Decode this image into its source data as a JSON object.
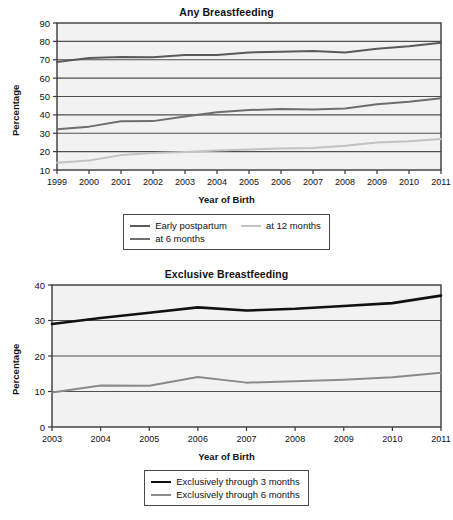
{
  "charts": [
    {
      "id": "any",
      "title": "Any Breastfeeding",
      "xlabel": "Year of Birth",
      "ylabel": "Percentage",
      "legend": [
        {
          "label": "Early postpartum",
          "color": "#5a5a5a",
          "width": 2.0
        },
        {
          "label": "at 12 months",
          "color": "#c2c2c2",
          "width": 2.0
        },
        {
          "label": "at 6 months",
          "color": "#6e6e6e",
          "width": 2.0
        }
      ]
    },
    {
      "id": "exclusive",
      "title": "Exclusive Breastfeeding",
      "xlabel": "Year of Birth",
      "ylabel": "Percentage",
      "legend": [
        {
          "label": "Exclusively through 3 months",
          "color": "#111111",
          "width": 2.6
        },
        {
          "label": "Exclusively through 6 months",
          "color": "#8a8a8a",
          "width": 2.0
        }
      ]
    }
  ],
  "chart_data": [
    {
      "type": "line",
      "id": "any",
      "title": "Any Breastfeeding",
      "xlabel": "Year of Birth",
      "ylabel": "Percentage",
      "x": [
        1999,
        2000,
        2001,
        2002,
        2003,
        2004,
        2005,
        2006,
        2007,
        2008,
        2009,
        2010,
        2011
      ],
      "xticklabels": [
        "1999",
        "2000",
        "2001",
        "2002",
        "2003",
        "2004",
        "2005",
        "2006",
        "2007",
        "2008",
        "2009",
        "2010",
        "2011"
      ],
      "xlim": [
        1999,
        2011
      ],
      "ylim": [
        10,
        90
      ],
      "yticks": [
        10,
        20,
        30,
        40,
        50,
        60,
        70,
        80,
        90
      ],
      "grid": "horizontal",
      "legend_position": "below",
      "series": [
        {
          "name": "Early postpartum",
          "color": "#5a5a5a",
          "values": [
            68.8,
            71.0,
            71.5,
            71.3,
            72.6,
            72.6,
            74.0,
            74.4,
            74.8,
            74.0,
            76.0,
            77.4,
            79.2
          ]
        },
        {
          "name": "at 6 months",
          "color": "#6e6e6e",
          "values": [
            32.2,
            33.6,
            36.5,
            36.6,
            39.1,
            41.4,
            42.6,
            43.2,
            42.9,
            43.5,
            45.8,
            47.2,
            49.0
          ]
        },
        {
          "name": "at 12 months",
          "color": "#c2c2c2",
          "values": [
            14.0,
            15.2,
            18.1,
            19.2,
            19.8,
            20.6,
            21.2,
            21.7,
            22.0,
            23.2,
            24.9,
            25.6,
            26.9
          ]
        }
      ]
    },
    {
      "type": "line",
      "id": "exclusive",
      "title": "Exclusive Breastfeeding",
      "xlabel": "Year of Birth",
      "ylabel": "Percentage",
      "x": [
        2003,
        2004,
        2005,
        2006,
        2007,
        2008,
        2009,
        2010,
        2011
      ],
      "xticklabels": [
        "2003",
        "2004",
        "2005",
        "2006",
        "2007",
        "2008",
        "2009",
        "2010",
        "2011"
      ],
      "xlim": [
        2003,
        2011
      ],
      "ylim": [
        0,
        40
      ],
      "yticks": [
        0,
        10,
        20,
        30,
        40
      ],
      "grid": "horizontal",
      "legend_position": "below",
      "series": [
        {
          "name": "Exclusively through 3 months",
          "color": "#111111",
          "values": [
            29.0,
            30.7,
            32.2,
            33.7,
            32.8,
            33.3,
            34.1,
            34.9,
            37.0
          ]
        },
        {
          "name": "Exclusively through 6 months",
          "color": "#8a8a8a",
          "values": [
            9.7,
            11.7,
            11.6,
            14.1,
            12.5,
            12.9,
            13.3,
            14.0,
            15.3
          ]
        }
      ]
    }
  ]
}
